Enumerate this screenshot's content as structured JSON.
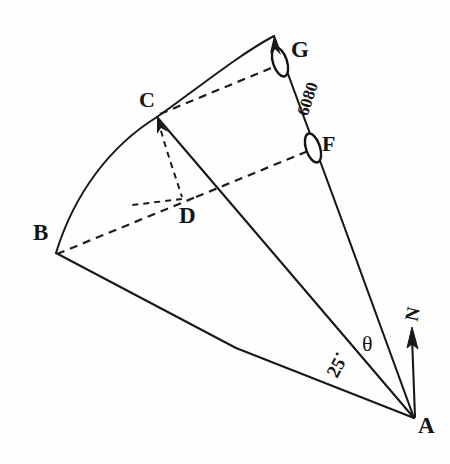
{
  "diagram": {
    "style": {
      "ink_color": "#181818",
      "background": "#fefefe"
    },
    "vertices": [
      {
        "id": "B",
        "label": "B",
        "x": 55,
        "y": 252
      },
      {
        "id": "C",
        "label": "C",
        "x": 156,
        "y": 116
      },
      {
        "id": "D",
        "label": "D",
        "x": 196,
        "y": 197
      },
      {
        "id": "F",
        "label": "F",
        "x": 313,
        "y": 148
      },
      {
        "id": "G",
        "label": "G",
        "x": 280,
        "y": 62
      },
      {
        "id": "A",
        "label": "A",
        "x": 415,
        "y": 419
      },
      {
        "id": "Apex",
        "label": "",
        "x": 273,
        "y": 35
      }
    ],
    "labels": {
      "B": "B",
      "C": "C",
      "D": "D",
      "F": "F",
      "G": "G",
      "A": "A",
      "north": "N",
      "theta": "θ",
      "angle_25": "25˙",
      "distance_6080": "6080"
    },
    "solid_edges": [
      {
        "name": "edge-A-B",
        "from": "A",
        "to": "B"
      },
      {
        "name": "edge-A-C",
        "from": "A",
        "to": "C"
      },
      {
        "name": "edge-A-apex",
        "from": "A",
        "to": "Apex"
      },
      {
        "name": "edge-B-C-arc",
        "from": "B",
        "to": "C",
        "kind": "arc"
      },
      {
        "name": "edge-C-apex-arc",
        "from": "C",
        "to": "Apex",
        "kind": "arc"
      }
    ],
    "dashed_edges": [
      {
        "name": "edge-B-D-dashed",
        "from": "B",
        "to": "D"
      },
      {
        "name": "edge-D-F-dashed",
        "from": "D",
        "to": "F"
      },
      {
        "name": "edge-C-G-dashed",
        "from": "C",
        "to": "G"
      },
      {
        "name": "edge-C-D-dashed",
        "from": "C",
        "to": "D"
      },
      {
        "name": "edge-D-tick-dashed",
        "from": "D",
        "to": "left-tick"
      }
    ],
    "markers": [
      {
        "name": "marker-G",
        "label": "G",
        "x": 280,
        "y": 62,
        "rx": 7,
        "ry": 15,
        "rotation": -18
      },
      {
        "name": "marker-F",
        "label": "F",
        "x": 313,
        "y": 148,
        "rx": 7,
        "ry": 15,
        "rotation": -18
      }
    ],
    "north_arrow": {
      "label": "N",
      "from_x": 415,
      "from_y": 417,
      "to_x": 412,
      "to_y": 330
    },
    "angles": [
      {
        "name": "angle-theta",
        "label": "θ",
        "at": "A",
        "between": [
          "A-apex",
          "A-north"
        ]
      },
      {
        "name": "angle-25",
        "label": "25˙",
        "at": "A",
        "between": [
          "A-B",
          "A-C"
        ]
      }
    ],
    "annotations": [
      {
        "name": "distance-6080",
        "label": "6080",
        "along": "G-F"
      }
    ]
  }
}
